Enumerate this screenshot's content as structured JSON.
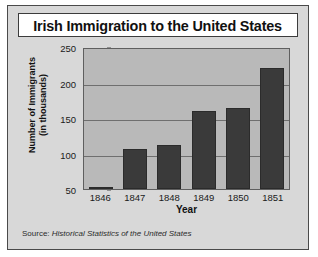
{
  "figure": {
    "title": "Irish Immigration to the United States",
    "source_prefix": "Source:",
    "source_title": "Historical Statistics of the United States"
  },
  "colors": {
    "bar": "#3a3a3a",
    "plot_background": "#b9b9b9",
    "card_background": "#d8d8d8",
    "gridline": "#6f6f6f",
    "border": "#4a4a4a",
    "title_background": "#ffffff"
  },
  "chart_data": {
    "type": "bar",
    "title": "Irish Immigration to the United States",
    "subtitle": "",
    "xlabel": "Year",
    "ylabel": "Number of Immigrants (in thousands)",
    "ylabel_line1": "Number of Immigrants",
    "ylabel_line2": "(in thousands)",
    "categories": [
      "1846",
      "1847",
      "1848",
      "1849",
      "1850",
      "1851"
    ],
    "values": [
      51,
      106,
      112,
      160,
      164,
      221
    ],
    "yticks": [
      50,
      100,
      150,
      200,
      250
    ],
    "ytick_labels": [
      "50",
      "100",
      "150",
      "200",
      "250"
    ],
    "ylim": [
      50,
      250
    ],
    "grid": true,
    "legend": "none",
    "units": "thousands of immigrants",
    "annotations": []
  }
}
